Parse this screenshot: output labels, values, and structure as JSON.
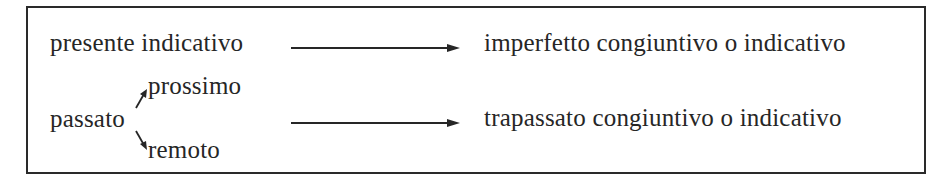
{
  "diagram": {
    "row1": {
      "source": "presente indicativo",
      "target": "imperfetto congiuntivo o indicativo"
    },
    "row2": {
      "source": "passato",
      "branch_upper": "prossimo",
      "branch_lower": "remoto",
      "target": "trapassato congiuntivo o indicativo"
    },
    "colors": {
      "ink": "#262626",
      "border": "#2a2a2a",
      "background": "#ffffff"
    }
  }
}
